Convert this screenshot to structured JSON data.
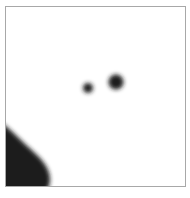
{
  "image": {
    "description": "Blurry dark shapes on white inside a thin gray frame",
    "frame_color": "#a8a8a8",
    "shape_color": "#1e1e1e",
    "shapes": [
      {
        "kind": "dot",
        "cx": 82,
        "cy": 81,
        "r": 5
      },
      {
        "kind": "dot",
        "cx": 110,
        "cy": 75,
        "r": 7
      },
      {
        "kind": "blob",
        "location": "bottom-left"
      }
    ]
  }
}
